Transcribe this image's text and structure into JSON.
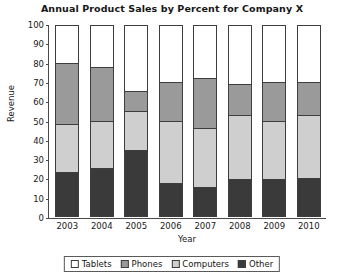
{
  "chart_data": {
    "type": "bar",
    "subtype": "stacked-bar-100",
    "title": "Annual Product Sales by Percent for Company X",
    "xlabel": "Year",
    "ylabel": "Revenue",
    "ylim": [
      0,
      100
    ],
    "yticks": [
      0,
      10,
      20,
      30,
      40,
      50,
      60,
      70,
      80,
      90,
      100
    ],
    "grid": false,
    "legend_position": "bottom",
    "categories": [
      "2003",
      "2004",
      "2005",
      "2006",
      "2007",
      "2008",
      "2009",
      "2010"
    ],
    "series": [
      {
        "name": "Other",
        "color": "#3a3a3a",
        "values": [
          23,
          25,
          35,
          17,
          15,
          19,
          19,
          20
        ]
      },
      {
        "name": "Computers",
        "color": "#cfcfcf",
        "values": [
          25,
          25,
          20,
          33,
          31,
          34,
          31,
          33
        ]
      },
      {
        "name": "Phones",
        "color": "#9a9a9a",
        "values": [
          32,
          28,
          10,
          20,
          26,
          16,
          20,
          17
        ]
      },
      {
        "name": "Tablets",
        "color": "#ffffff",
        "values": [
          20,
          22,
          35,
          30,
          28,
          31,
          30,
          30
        ]
      }
    ],
    "stack_boundaries": {
      "2003": [
        23,
        48,
        80,
        100
      ],
      "2004": [
        25,
        50,
        78,
        100
      ],
      "2005": [
        35,
        55,
        65,
        100
      ],
      "2006": [
        17,
        50,
        70,
        100
      ],
      "2007": [
        15,
        46,
        72,
        100
      ],
      "2008": [
        19,
        53,
        69,
        100
      ],
      "2009": [
        19,
        50,
        70,
        100
      ],
      "2010": [
        20,
        53,
        70,
        100
      ]
    }
  },
  "legend": {
    "items": [
      {
        "label": "Tablets",
        "color": "#ffffff"
      },
      {
        "label": "Phones",
        "color": "#9a9a9a"
      },
      {
        "label": "Computers",
        "color": "#cfcfcf"
      },
      {
        "label": "Other",
        "color": "#3a3a3a"
      }
    ]
  }
}
